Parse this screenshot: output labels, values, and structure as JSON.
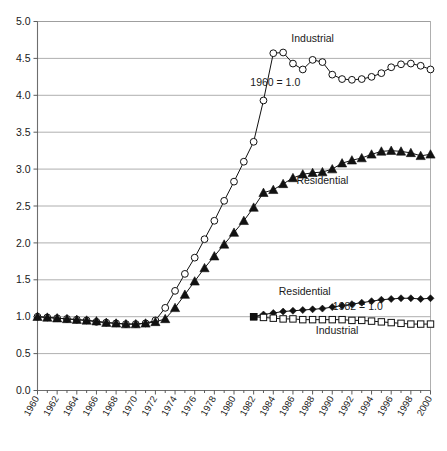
{
  "chart_data": {
    "type": "line",
    "title": "",
    "xlabel": "",
    "ylabel": "",
    "xlim": [
      1960,
      2000
    ],
    "ylim": [
      0.0,
      5.0
    ],
    "grid": true,
    "legend": "inline-annotations",
    "ytick_labels": [
      "0.0",
      "0.5",
      "1.0",
      "1.5",
      "2.0",
      "2.5",
      "3.0",
      "3.5",
      "4.0",
      "4.5",
      "5.0"
    ],
    "ytick_values": [
      0.0,
      0.5,
      1.0,
      1.5,
      2.0,
      2.5,
      3.0,
      3.5,
      4.0,
      4.5,
      5.0
    ],
    "xtick_labels": [
      "1960",
      "1962",
      "1964",
      "1966",
      "1968",
      "1970",
      "1972",
      "1974",
      "1976",
      "1978",
      "1980",
      "1982",
      "1984",
      "1986",
      "1988",
      "1990",
      "1992",
      "1994",
      "1996",
      "1998",
      "2000"
    ],
    "xtick_values": [
      1960,
      1962,
      1964,
      1966,
      1968,
      1970,
      1972,
      1974,
      1976,
      1978,
      1980,
      1982,
      1984,
      1986,
      1988,
      1990,
      1992,
      1994,
      1996,
      1998,
      2000
    ],
    "annotations": [
      {
        "text": "Industrial",
        "x": 1988,
        "y": 4.72,
        "name": "industrial-1960-label"
      },
      {
        "text": "1960 = 1.0",
        "x": 1984.2,
        "y": 4.12,
        "name": "base-1960-annotation"
      },
      {
        "text": "Residential",
        "x": 1989,
        "y": 2.8,
        "name": "residential-1960-label"
      },
      {
        "text": "Residential",
        "x": 1987.2,
        "y": 1.3,
        "name": "residential-1982-label"
      },
      {
        "text": "1982 = 1.0",
        "x": 1992.6,
        "y": 1.09,
        "name": "base-1982-annotation"
      },
      {
        "text": "Industrial",
        "x": 1990.5,
        "y": 0.77,
        "name": "industrial-1982-label"
      }
    ],
    "series": [
      {
        "name": "Industrial (1960 = 1.0)",
        "marker": "open-circle",
        "x": [
          1960,
          1961,
          1962,
          1963,
          1964,
          1965,
          1966,
          1967,
          1968,
          1969,
          1970,
          1971,
          1972,
          1973,
          1974,
          1975,
          1976,
          1977,
          1978,
          1979,
          1980,
          1981,
          1982,
          1983,
          1984,
          1985,
          1986,
          1987,
          1988,
          1989,
          1990,
          1991,
          1992,
          1993,
          1994,
          1995,
          1996,
          1997,
          1998,
          1999,
          2000
        ],
        "values": [
          1.0,
          0.99,
          0.98,
          0.97,
          0.96,
          0.95,
          0.93,
          0.92,
          0.91,
          0.9,
          0.9,
          0.91,
          0.95,
          1.12,
          1.35,
          1.58,
          1.8,
          2.05,
          2.3,
          2.57,
          2.83,
          3.1,
          3.37,
          3.93,
          4.57,
          4.58,
          4.43,
          4.35,
          4.48,
          4.45,
          4.28,
          4.22,
          4.21,
          4.22,
          4.25,
          4.3,
          4.38,
          4.42,
          4.43,
          4.4,
          4.35
        ]
      },
      {
        "name": "Residential (1960 = 1.0)",
        "marker": "filled-triangle",
        "x": [
          1960,
          1961,
          1962,
          1963,
          1964,
          1965,
          1966,
          1967,
          1968,
          1969,
          1970,
          1971,
          1972,
          1973,
          1974,
          1975,
          1976,
          1977,
          1978,
          1979,
          1980,
          1981,
          1982,
          1983,
          1984,
          1985,
          1986,
          1987,
          1988,
          1989,
          1990,
          1991,
          1992,
          1993,
          1994,
          1995,
          1996,
          1997,
          1998,
          1999,
          2000
        ],
        "values": [
          1.0,
          0.99,
          0.98,
          0.97,
          0.96,
          0.95,
          0.94,
          0.92,
          0.91,
          0.9,
          0.9,
          0.91,
          0.93,
          0.97,
          1.12,
          1.3,
          1.48,
          1.66,
          1.82,
          1.98,
          2.14,
          2.3,
          2.48,
          2.68,
          2.72,
          2.8,
          2.88,
          2.93,
          2.95,
          2.96,
          3.0,
          3.08,
          3.12,
          3.15,
          3.2,
          3.24,
          3.25,
          3.24,
          3.22,
          3.18,
          3.2
        ]
      },
      {
        "name": "Residential (1982 = 1.0)",
        "marker": "filled-diamond",
        "x": [
          1982,
          1983,
          1984,
          1985,
          1986,
          1987,
          1988,
          1989,
          1990,
          1991,
          1992,
          1993,
          1994,
          1995,
          1996,
          1997,
          1998,
          1999,
          2000
        ],
        "values": [
          1.0,
          1.03,
          1.05,
          1.07,
          1.08,
          1.09,
          1.1,
          1.11,
          1.13,
          1.15,
          1.17,
          1.19,
          1.21,
          1.23,
          1.24,
          1.25,
          1.25,
          1.24,
          1.25
        ]
      },
      {
        "name": "Industrial (1982 = 1.0)",
        "marker": "open-square",
        "x": [
          1982,
          1983,
          1984,
          1985,
          1986,
          1987,
          1988,
          1989,
          1990,
          1991,
          1992,
          1993,
          1994,
          1995,
          1996,
          1997,
          1998,
          1999,
          2000
        ],
        "values": [
          1.0,
          0.99,
          0.98,
          0.97,
          0.97,
          0.96,
          0.96,
          0.96,
          0.96,
          0.96,
          0.95,
          0.95,
          0.94,
          0.93,
          0.92,
          0.91,
          0.9,
          0.9,
          0.9
        ]
      }
    ]
  }
}
